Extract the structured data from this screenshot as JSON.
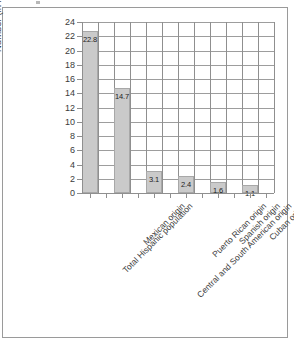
{
  "chart_data": {
    "type": "bar",
    "title": "",
    "xlabel": "",
    "ylabel": "Number (in millions)",
    "ylim": [
      0,
      24
    ],
    "ytick_step": 2,
    "yticks": [
      "24",
      "22",
      "20",
      "18",
      "16",
      "14",
      "12",
      "10",
      "8",
      "6",
      "4",
      "2",
      "0"
    ],
    "grid": "both",
    "legend": "none",
    "bar_color": "#cacaca",
    "bar_border_color": "#a8a8a8",
    "categories": [
      "Total Hispanic population",
      "Mexican origin",
      "Central and South American origin",
      "Puerto Rican origin",
      "Spanish origin",
      "Cuban origin"
    ],
    "values": [
      22.8,
      14.7,
      3.1,
      2.4,
      1.6,
      1.1
    ],
    "value_labels": [
      "22.8",
      "14.7",
      "3.1",
      "2.4",
      "1.6",
      "1.1"
    ]
  }
}
